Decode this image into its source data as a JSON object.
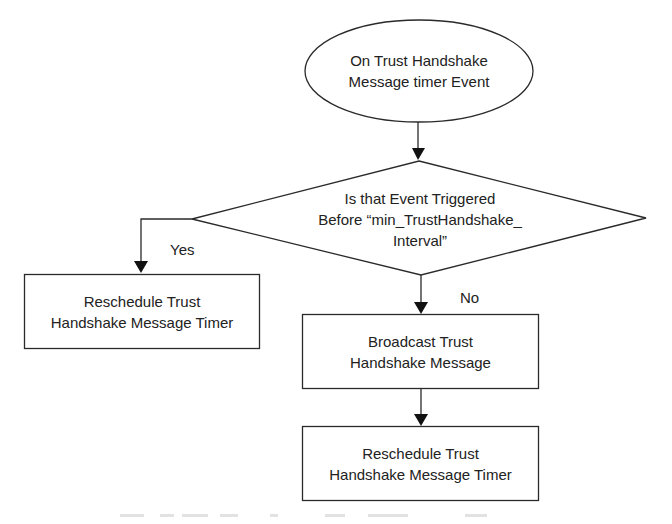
{
  "diagram": {
    "type": "flowchart",
    "nodes": {
      "start": {
        "shape": "ellipse",
        "lines": [
          "On Trust Handshake",
          "Message timer Event"
        ]
      },
      "decision": {
        "shape": "diamond",
        "lines": [
          "Is that Event Triggered",
          "Before “min_TrustHandshake_",
          "Interval”"
        ]
      },
      "reschedule_yes": {
        "shape": "rectangle",
        "lines": [
          "Reschedule Trust",
          "Handshake Message Timer"
        ]
      },
      "broadcast": {
        "shape": "rectangle",
        "lines": [
          "Broadcast Trust",
          "Handshake Message"
        ]
      },
      "reschedule_no": {
        "shape": "rectangle",
        "lines": [
          "Reschedule Trust",
          "Handshake Message Timer"
        ]
      }
    },
    "edges": [
      {
        "from": "start",
        "to": "decision",
        "label": ""
      },
      {
        "from": "decision",
        "to": "reschedule_yes",
        "label": "Yes"
      },
      {
        "from": "decision",
        "to": "broadcast",
        "label": "No"
      },
      {
        "from": "broadcast",
        "to": "reschedule_no",
        "label": ""
      }
    ],
    "labels": {
      "yes": "Yes",
      "no": "No"
    },
    "colors": {
      "stroke": "#2a2a2a",
      "fill": "#ffffff",
      "text": "#222222"
    }
  }
}
